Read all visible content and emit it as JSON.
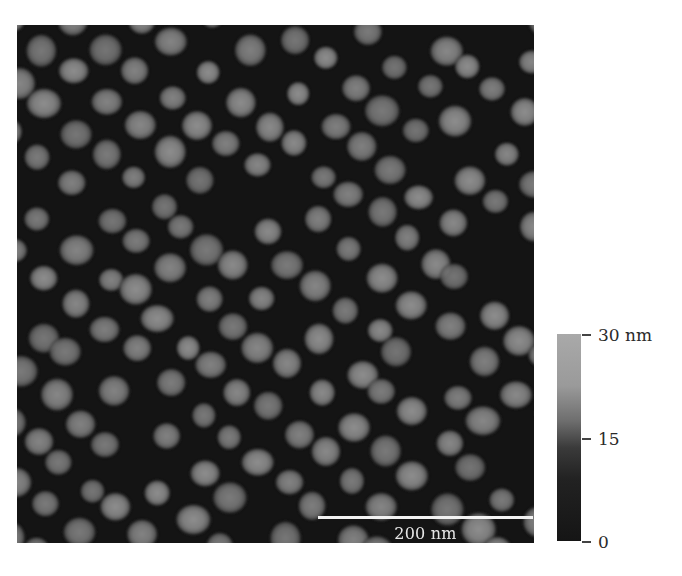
{
  "figure": {
    "type": "AFM height image",
    "scale_bar": {
      "label": "200 nm"
    },
    "colorbar": {
      "ticks": [
        {
          "label": "30 nm",
          "value": 30
        },
        {
          "label": "15",
          "value": 15
        },
        {
          "label": "0",
          "value": 0
        }
      ],
      "color_low": "#151515",
      "color_high": "#a9a9a9"
    },
    "background_color": "#141414",
    "particle_color": "#8a8a8a"
  }
}
